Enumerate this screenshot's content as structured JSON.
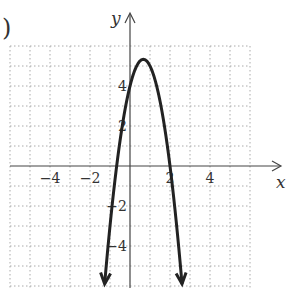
{
  "prefix": ")",
  "chart_data": {
    "type": "line",
    "title": "",
    "xlabel": "x",
    "ylabel": "y",
    "xlim": [
      -6,
      6
    ],
    "ylim": [
      -6,
      6
    ],
    "grid": true,
    "grid_style": "dotted",
    "x_ticks": [
      -4,
      -2,
      2,
      4
    ],
    "x_tick_labels": [
      "−4",
      "−2",
      "2",
      "4"
    ],
    "y_ticks": [
      4,
      2,
      -2,
      -4
    ],
    "y_tick_labels": [
      "4",
      "2",
      "−2",
      "−4"
    ],
    "series": [
      {
        "name": "parabola",
        "equation": "y = -3x^2 + 4x + 4",
        "vertex": [
          0.67,
          5.33
        ],
        "x_intercepts": [
          -0.67,
          2
        ],
        "y_intercept": 4,
        "opens": "down",
        "arrows_at_ends": true,
        "color": "#222222"
      }
    ]
  }
}
